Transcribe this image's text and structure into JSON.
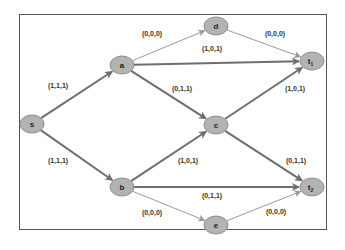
{
  "diagram": {
    "type": "flow-network",
    "nodes": [
      {
        "id": "s",
        "label": "s",
        "sub": "",
        "x": 32,
        "y": 124
      },
      {
        "id": "a",
        "label": "a",
        "sub": "",
        "x": 122,
        "y": 65
      },
      {
        "id": "b",
        "label": "b",
        "sub": "",
        "x": 122,
        "y": 187
      },
      {
        "id": "c",
        "label": "c",
        "sub": "",
        "x": 216,
        "y": 125
      },
      {
        "id": "d",
        "label": "d",
        "sub": "",
        "x": 216,
        "y": 26
      },
      {
        "id": "e",
        "label": "e",
        "sub": "",
        "x": 216,
        "y": 225
      },
      {
        "id": "t1",
        "label": "t",
        "sub": "1",
        "x": 312,
        "y": 61
      },
      {
        "id": "t2",
        "label": "t",
        "sub": "2",
        "x": 312,
        "y": 187
      }
    ],
    "edges": [
      {
        "from": "s",
        "to": "a",
        "label": "(1,1,1)",
        "lx": 58,
        "ly": 88,
        "heavy": true
      },
      {
        "from": "s",
        "to": "b",
        "label": "(1,1,1)",
        "lx": 58,
        "ly": 163,
        "heavy": true
      },
      {
        "from": "a",
        "to": "d",
        "label": "(0,0,0)",
        "lx": 152,
        "ly": 36,
        "heavy": false
      },
      {
        "from": "a",
        "to": "t1",
        "label": "(1,0,1)",
        "lx": 212,
        "ly": 51,
        "heavy": true
      },
      {
        "from": "a",
        "to": "c",
        "label": "(0,1,1)",
        "lx": 182,
        "ly": 91,
        "heavy": true
      },
      {
        "from": "d",
        "to": "t1",
        "label": "(0,0,0)",
        "lx": 275,
        "ly": 36,
        "heavy": false
      },
      {
        "from": "c",
        "to": "t1",
        "label": "(1,0,1)",
        "lx": 295,
        "ly": 91,
        "heavy": true
      },
      {
        "from": "b",
        "to": "c",
        "label": "(1,0,1)",
        "lx": 188,
        "ly": 163,
        "heavy": true
      },
      {
        "from": "c",
        "to": "t2",
        "label": "(0,1,1)",
        "lx": 296,
        "ly": 163,
        "heavy": true
      },
      {
        "from": "b",
        "to": "t2",
        "label": "(0,1,1)",
        "lx": 212,
        "ly": 198,
        "heavy": true
      },
      {
        "from": "b",
        "to": "e",
        "label": "(0,0,0)",
        "lx": 152,
        "ly": 215,
        "heavy": false
      },
      {
        "from": "e",
        "to": "t2",
        "label": "(0,0,0)",
        "lx": 276,
        "ly": 214,
        "heavy": false
      }
    ],
    "colors": {
      "node_fill": "#b3b3b3",
      "node_stroke": "#8c8c8c",
      "heavy_edge": "#6e6e6e",
      "light_edge": "#9a9a9a",
      "frame": "#555555"
    }
  }
}
